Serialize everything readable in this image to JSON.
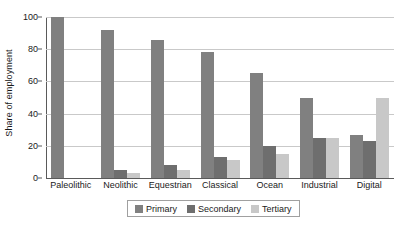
{
  "chart_data": {
    "type": "bar",
    "title": "",
    "subtitle": "",
    "xlabel": "",
    "ylabel": "Share of employment",
    "ylim": [
      0,
      100
    ],
    "yticks": [
      0,
      20,
      40,
      60,
      80,
      100
    ],
    "grid": "horizontal",
    "legend_position": "bottom",
    "categories": [
      "Paleolithic",
      "Neolithic",
      "Equestrian",
      "Classical",
      "Ocean",
      "Industrial",
      "Digital"
    ],
    "series": [
      {
        "name": "Primary",
        "color": "#808080",
        "values": [
          100,
          92,
          86,
          78,
          65,
          50,
          27
        ]
      },
      {
        "name": "Secondary",
        "color": "#6e6e6e",
        "values": [
          0,
          5,
          8,
          13,
          20,
          25,
          23
        ]
      },
      {
        "name": "Tertiary",
        "color": "#c8c8c8",
        "values": [
          0,
          3,
          5,
          11,
          15,
          25,
          50
        ]
      }
    ]
  },
  "axis": {
    "grid_color": "#c9c9c9",
    "axis_color": "#5a5a5a"
  }
}
